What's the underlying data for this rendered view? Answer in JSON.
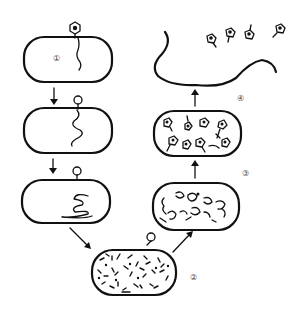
{
  "diagram": {
    "stage_labels": [
      {
        "id": "stage-1",
        "text": "①",
        "meaning": "adsorption and injection of phage DNA"
      },
      {
        "id": "stage-2",
        "text": "②",
        "meaning": "synthesis of phage components inside host"
      },
      {
        "id": "stage-3",
        "text": "③",
        "meaning": "assembly of phage particles"
      },
      {
        "id": "stage-4",
        "text": "④",
        "meaning": "lysis and release of progeny phages"
      }
    ],
    "colors": {
      "ink": "#111111",
      "background": "#ffffff",
      "label": "#444444"
    },
    "elements": {
      "left_column_cells": 3,
      "arrows": [
        "down",
        "down",
        "diagonal-down-right",
        "diagonal-up-right",
        "up",
        "up"
      ],
      "released_phages": 4
    }
  }
}
